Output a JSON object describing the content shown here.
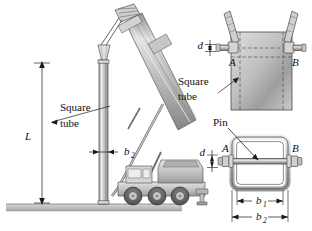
{
  "figure": {
    "background_color": "#ffffff",
    "line_color": "#1a1a1a",
    "metal_light": "#e8e8e8",
    "metal_mid": "#b9b9b9",
    "metal_dark": "#8a8a8a",
    "ground_color": "#c9c9c9"
  },
  "main_view": {
    "name": "crane-elevation-view",
    "labels": {
      "square_tube": "Square\ntube",
      "square_tube_line1": "Square",
      "square_tube_line2": "tube",
      "length_dim": "L",
      "width_dim": "b",
      "width_dim_sub": "2"
    },
    "truck": {
      "wheel_count": 6,
      "has_cab": true,
      "has_boom": true
    }
  },
  "detail_top": {
    "name": "pin-connection-front-detail",
    "labels": {
      "pin_diameter": "d",
      "point_a": "A",
      "point_b": "B",
      "square_tube_line1": "Square",
      "square_tube_line2": "tube"
    }
  },
  "detail_bottom": {
    "name": "pin-cross-section-detail",
    "labels": {
      "pin": "Pin",
      "pin_diameter": "d",
      "point_a": "A",
      "point_b": "B",
      "inner_width": "b",
      "inner_width_sub": "1",
      "outer_width": "b",
      "outer_width_sub": "2"
    }
  }
}
